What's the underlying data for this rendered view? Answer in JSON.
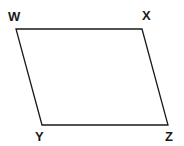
{
  "diagram": {
    "type": "parallelogram",
    "name": "WXYZ",
    "stroke_color": "#1a1a1a",
    "fill_color": "#ffffff",
    "vertices": [
      {
        "label": "W",
        "x": 16,
        "y": 29,
        "label_x": 8,
        "label_y": 21
      },
      {
        "label": "X",
        "x": 142,
        "y": 29,
        "label_x": 142,
        "label_y": 20
      },
      {
        "label": "Z",
        "x": 168,
        "y": 125,
        "label_x": 165,
        "label_y": 141
      },
      {
        "label": "Y",
        "x": 42,
        "y": 125,
        "label_x": 35,
        "label_y": 141
      }
    ],
    "edges": [
      [
        "W",
        "X"
      ],
      [
        "X",
        "Z"
      ],
      [
        "Z",
        "Y"
      ],
      [
        "Y",
        "W"
      ]
    ]
  }
}
